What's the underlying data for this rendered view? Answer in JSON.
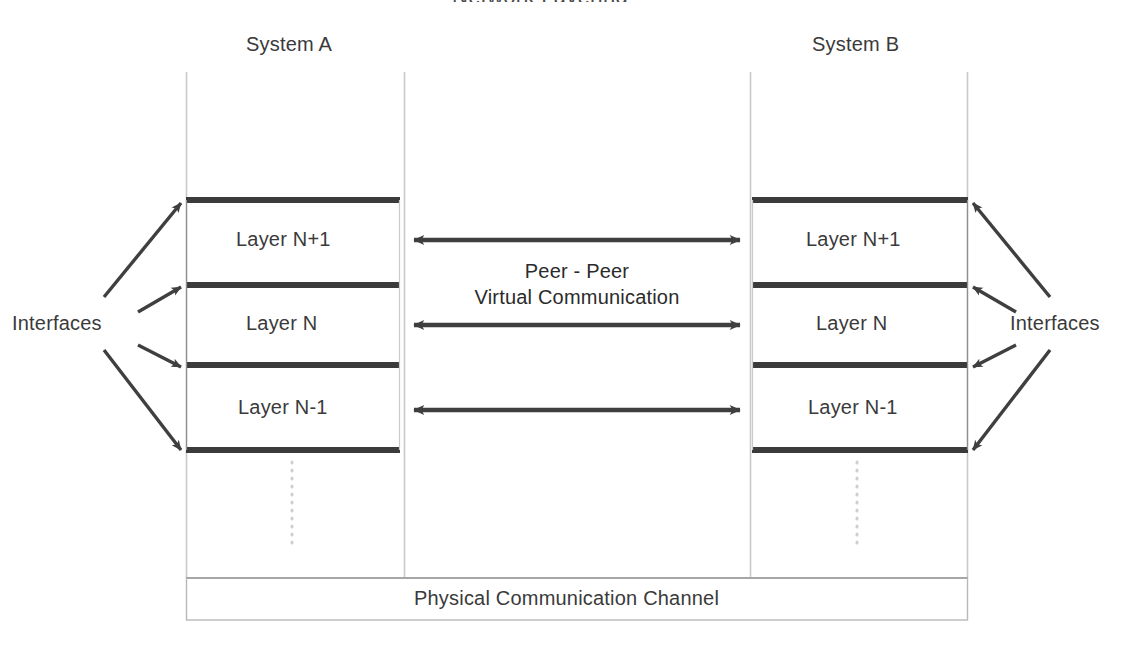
{
  "diagram": {
    "title_partial": "Network Layering",
    "systems": [
      {
        "id": "system-a",
        "label": "System A"
      },
      {
        "id": "system-b",
        "label": "System B"
      }
    ],
    "layers": [
      {
        "label": "Layer N+1"
      },
      {
        "label": "Layer N"
      },
      {
        "label": "Layer N-1"
      }
    ],
    "layers_right": [
      {
        "label": "Layer N+1"
      },
      {
        "label": "Layer N"
      },
      {
        "label": "Layer N-1"
      }
    ],
    "interfaces_left": "Interfaces",
    "interfaces_right": "Interfaces",
    "peer_line_1": "Peer - Peer",
    "peer_line_2": "Virtual Communication",
    "channel_label": "Physical Communication Channel",
    "continuation_marker": "vertical dotted ellipsis",
    "colors": {
      "bar": "#3b3b3b",
      "arrow": "#3f3f3f",
      "divider": "#c9c9c9",
      "box_border": "#b4b4b4",
      "dotted": "#cfcfcf",
      "text": "#3a3a3a",
      "background": "#ffffff"
    },
    "geometry": {
      "left_column_x": 186,
      "left_column_right_x": 404,
      "right_column_x": 750,
      "right_column_right_x": 968,
      "bar_y_positions": [
        200,
        285,
        365,
        450
      ],
      "arrow_y_positions": [
        240,
        325,
        410
      ],
      "channel_box": {
        "x": 186,
        "y": 578,
        "width": 782,
        "height": 42
      }
    }
  }
}
